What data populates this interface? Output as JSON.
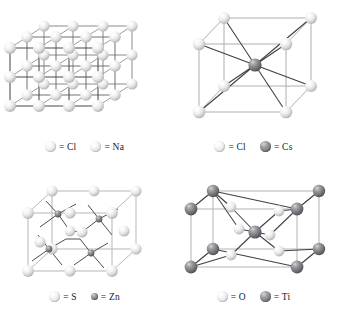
{
  "figure": {
    "background_color": "#ffffff",
    "sphere_light_color": "#ececed",
    "sphere_dark_color": "#86868b",
    "bond_dark_color": "#4a4a4a",
    "bond_light_color": "#b5b5b8"
  },
  "panels": [
    {
      "id": "nacl",
      "structure_name": "rock-salt",
      "legend": [
        {
          "marker": "light-sphere",
          "size": "big",
          "label": "= Cl"
        },
        {
          "marker": "light-sphere",
          "size": "big",
          "label": "= Na"
        }
      ]
    },
    {
      "id": "cscl",
      "structure_name": "cesium-chloride",
      "legend": [
        {
          "marker": "light-sphere",
          "size": "big",
          "label": "= Cl"
        },
        {
          "marker": "dark-sphere",
          "size": "big",
          "label": "= Cs"
        }
      ]
    },
    {
      "id": "zns",
      "structure_name": "zinc-blende",
      "legend": [
        {
          "marker": "light-sphere",
          "size": "big",
          "label": "= S"
        },
        {
          "marker": "dark-sphere",
          "size": "small",
          "label": "= Zn"
        }
      ]
    },
    {
      "id": "tio2",
      "structure_name": "rutile",
      "legend": [
        {
          "marker": "light-sphere",
          "size": "big",
          "label": "= O"
        },
        {
          "marker": "dark-sphere",
          "size": "big",
          "label": "= Ti"
        }
      ]
    }
  ],
  "legend_labels": {
    "cl_1": "= Cl",
    "na": "= Na",
    "cl_2": "= Cl",
    "cs": "= Cs",
    "s": "= S",
    "zn": "= Zn",
    "o": "= O",
    "ti": "= Ti"
  }
}
